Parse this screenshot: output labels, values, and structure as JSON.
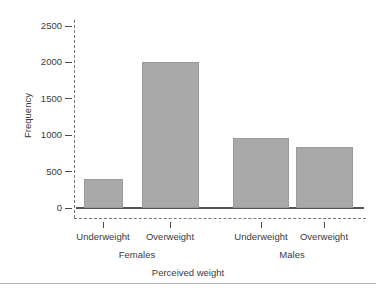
{
  "chart_data": {
    "type": "bar",
    "title": "",
    "subtitle": "",
    "xlabel": "Perceived weight",
    "ylabel": "Frequency",
    "categories": [
      "Underweight",
      "Overweight",
      "Underweight",
      "Overweight"
    ],
    "groups": [
      "Females",
      "Males"
    ],
    "group_spans": [
      2,
      2
    ],
    "values": [
      400,
      2000,
      960,
      840
    ],
    "bars": [
      {
        "group": "Females",
        "category": "Underweight",
        "value": 400
      },
      {
        "group": "Females",
        "category": "Overweight",
        "value": 2000
      },
      {
        "group": "Males",
        "category": "Underweight",
        "value": 960
      },
      {
        "group": "Males",
        "category": "Overweight",
        "value": 840
      }
    ],
    "ylim": [
      0,
      2500
    ],
    "yticks": [
      0,
      500,
      1000,
      1500,
      2000,
      2500
    ],
    "ytick_labels": [
      "0",
      "500",
      "1000",
      "1500",
      "2000",
      "2500"
    ],
    "grid": false,
    "legend": "none",
    "bar_color": "#a9a9a9",
    "axis_color": "#777777",
    "text_color": "#3b3b3b"
  }
}
